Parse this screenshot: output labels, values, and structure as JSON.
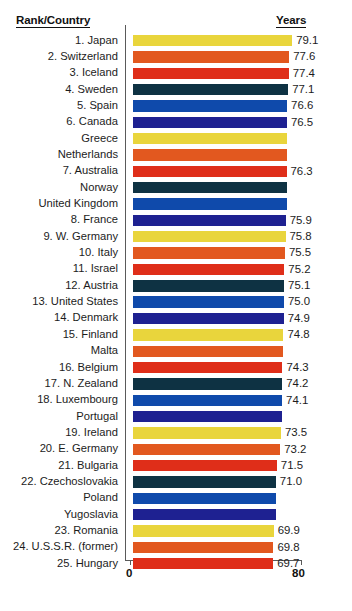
{
  "header": {
    "left_label": "Rank/Country",
    "right_label": "Years"
  },
  "axis": {
    "min_label": "0",
    "max_label": "80"
  },
  "colors": {
    "yellow": "#e9d53c",
    "orange": "#e2581f",
    "red": "#df2e19",
    "teal_dark": "#0e3243",
    "blue": "#0f4aab",
    "navy": "#1e2191",
    "text": "#1c1c1c",
    "rule": "#5a5a5a",
    "background": "#ffffff"
  },
  "chart_data": {
    "type": "bar",
    "title": "Rank/Country",
    "xlabel": "Years",
    "ylabel": "",
    "xlim": [
      0,
      80
    ],
    "grid": false,
    "legend": "none",
    "orientation": "horizontal",
    "categories": [
      "1. Japan",
      "2. Switzerland",
      "3. Iceland",
      "4. Sweden",
      "5. Spain",
      "6. Canada",
      "Greece",
      "Netherlands",
      "7. Australia",
      "Norway",
      "United Kingdom",
      "8. France",
      "9. W. Germany",
      "10. Italy",
      "11. Israel",
      "12. Austria",
      "13. United States",
      "14. Denmark",
      "15. Finland",
      "Malta",
      "16. Belgium",
      "17. N. Zealand",
      "18. Luxembourg",
      "Portugal",
      "19. Ireland",
      "20. E. Germany",
      "21. Bulgaria",
      "22. Czechoslovakia",
      "Poland",
      "Yugoslavia",
      "23. Romania",
      "24. U.S.S.R. (former)",
      "25. Hungary"
    ],
    "values": [
      79.1,
      77.6,
      77.4,
      77.1,
      76.6,
      76.5,
      76.5,
      76.5,
      76.3,
      76.3,
      76.3,
      75.9,
      75.8,
      75.5,
      75.2,
      75.1,
      75.0,
      74.9,
      74.8,
      74.8,
      74.3,
      74.2,
      74.1,
      74.1,
      73.5,
      73.2,
      71.5,
      71.0,
      71.0,
      71.0,
      69.9,
      69.8,
      69.7
    ],
    "value_labels": [
      "79.1",
      "77.6",
      "77.4",
      "77.1",
      "76.6",
      "76.5",
      "",
      "",
      "76.3",
      "",
      "",
      "75.9",
      "75.8",
      "75.5",
      "75.2",
      "75.1",
      "75.0",
      "74.9",
      "74.8",
      "",
      "74.3",
      "74.2",
      "74.1",
      "",
      "73.5",
      "73.2",
      "71.5",
      "71.0",
      "",
      "",
      "69.9",
      "69.8",
      "69.7"
    ],
    "bar_colors": [
      "#e9d53c",
      "#e2581f",
      "#df2e19",
      "#0e3243",
      "#0f4aab",
      "#1e2191",
      "#e9d53c",
      "#e2581f",
      "#df2e19",
      "#0e3243",
      "#0f4aab",
      "#1e2191",
      "#e9d53c",
      "#e2581f",
      "#df2e19",
      "#0e3243",
      "#0f4aab",
      "#1e2191",
      "#e9d53c",
      "#e2581f",
      "#df2e19",
      "#0e3243",
      "#0f4aab",
      "#1e2191",
      "#e9d53c",
      "#e2581f",
      "#df2e19",
      "#0e3243",
      "#0f4aab",
      "#1e2191",
      "#e9d53c",
      "#e2581f",
      "#df2e19"
    ]
  }
}
